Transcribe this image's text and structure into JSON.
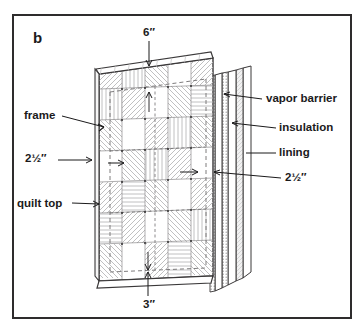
{
  "figure": {
    "panel_id": "b",
    "border_color": "#2e2c2d",
    "background_color": "#ffffff",
    "ink_color": "#1b1a1b",
    "line_color": "#3a3839",
    "hatch_color": "#b9b9ba",
    "dash_color": "#6f6d6e"
  },
  "labels": {
    "left": [
      {
        "id": "frame",
        "text": "frame",
        "x": 24,
        "y": 114
      },
      {
        "id": "thickness",
        "text": "2½″",
        "x": 25,
        "y": 157
      },
      {
        "id": "quilt_top",
        "text": "quilt top",
        "x": 17,
        "y": 202
      }
    ],
    "right": [
      {
        "id": "vapor_barrier",
        "text": "vapor barrier",
        "x": 266,
        "y": 97
      },
      {
        "id": "insulation",
        "text": "insulation",
        "x": 279,
        "y": 127
      },
      {
        "id": "lining",
        "text": "lining",
        "x": 279,
        "y": 151
      },
      {
        "id": "spacing",
        "text": "2½″",
        "x": 285,
        "y": 176
      }
    ]
  },
  "dimensions": {
    "top": {
      "id": "top_dimension",
      "text": "6″",
      "x": 143,
      "y": 33
    },
    "bottom": {
      "id": "bottom_dimension",
      "text": "3″",
      "x": 143,
      "y": 303
    }
  },
  "layers": [
    {
      "name": "quilt top",
      "order": 1,
      "style": "patchwork-hatched"
    },
    {
      "name": "frame",
      "order": 2,
      "style": "dashed-outline"
    },
    {
      "name": "vapor barrier",
      "order": 3,
      "style": "stippled-thin"
    },
    {
      "name": "insulation",
      "order": 4,
      "style": "light-fill"
    },
    {
      "name": "lining",
      "order": 5,
      "style": "plain-thin"
    }
  ],
  "quilt_grid": {
    "columns": 5,
    "rows": 7,
    "block_styles": [
      [
        "diag-right",
        "vert",
        "diag-left",
        "plain",
        "diag-right"
      ],
      [
        "vert",
        "diag-right",
        "plain",
        "diag-left",
        "horiz"
      ],
      [
        "diag-left",
        "plain",
        "diag-right",
        "vert",
        "diag-left"
      ],
      [
        "plain",
        "diag-left",
        "vert",
        "diag-right",
        "plain"
      ],
      [
        "diag-right",
        "horiz",
        "diag-left",
        "plain",
        "diag-right"
      ],
      [
        "horiz",
        "diag-right",
        "plain",
        "diag-left",
        "vert"
      ],
      [
        "diag-left",
        "plain",
        "diag-right",
        "horiz",
        "diag-left"
      ]
    ]
  }
}
